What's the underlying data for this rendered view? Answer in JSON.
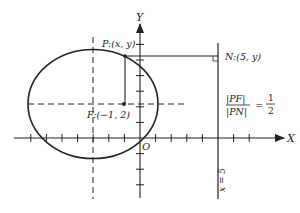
{
  "diagram": {
    "type": "conic-section",
    "axes": {
      "x_label": "X",
      "y_label": "Y",
      "origin_label": "O"
    },
    "labels": {
      "point_p": "P:(x, y)",
      "point_n": "N:(5, y)",
      "focus": "F:(−1, 2)",
      "directrix": "x = 5",
      "ratio_num": "|PF|",
      "ratio_den": "|PN|",
      "ratio_eq": "=",
      "ratio_value_num": "1",
      "ratio_value_den": "2"
    },
    "geometry": {
      "ellipse_center": [
        -3,
        2
      ],
      "focus": [
        -1,
        2
      ],
      "directrix_x": 5,
      "eccentricity": "1/2",
      "unit_px": 15.6,
      "origin_px": [
        140,
        138
      ]
    },
    "colors": {
      "stroke": "#222222",
      "background": "#ffffff"
    }
  }
}
